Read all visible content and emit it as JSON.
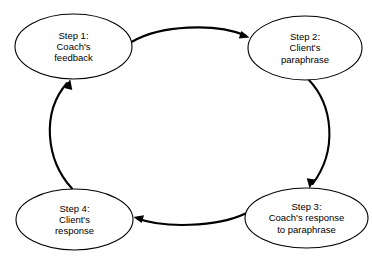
{
  "diagram": {
    "type": "cycle-diagram",
    "background_color": "#ffffff",
    "stroke_color": "#000000",
    "text_color": "#000000",
    "node_fill": "#ffffff",
    "nodes": [
      {
        "id": "step-1",
        "lines": [
          "Step 1:",
          "Coach's",
          "feedback"
        ],
        "line1": "Step 1:",
        "line2": "Coach's",
        "line3": "feedback",
        "cx": 73.5,
        "cy": 46.5,
        "rx": 58.5,
        "ry": 32.5
      },
      {
        "id": "step-2",
        "lines": [
          "Step 2:",
          "Client's",
          "paraphrase"
        ],
        "line1": "Step 2:",
        "line2": "Client's",
        "line3": "paraphrase",
        "cx": 305,
        "cy": 48,
        "rx": 57,
        "ry": 32
      },
      {
        "id": "step-3",
        "lines": [
          "Step 3:",
          "Coach's response",
          "to paraphrase"
        ],
        "line1": "Step 3:",
        "line2": "Coach's response",
        "line3": "to paraphrase",
        "cx": 306.5,
        "cy": 218,
        "rx": 61.5,
        "ry": 30
      },
      {
        "id": "step-4",
        "lines": [
          "Step 4:",
          "Client's",
          "response"
        ],
        "line1": "Step 4:",
        "line2": "Client's",
        "line3": "response",
        "cx": 74.5,
        "cy": 219.5,
        "rx": 58.5,
        "ry": 30.5
      }
    ],
    "connectors": [
      {
        "id": "arrow-step1-to-step2",
        "from": "step-1",
        "to": "step-2",
        "direction": "right",
        "label": ""
      },
      {
        "id": "arrow-step2-to-step3",
        "from": "step-2",
        "to": "step-3",
        "direction": "down",
        "label": ""
      },
      {
        "id": "arrow-step3-to-step4",
        "from": "step-3",
        "to": "step-4",
        "direction": "left",
        "label": ""
      },
      {
        "id": "arrow-step4-to-step1",
        "from": "step-4",
        "to": "step-1",
        "direction": "up",
        "label": ""
      }
    ]
  }
}
